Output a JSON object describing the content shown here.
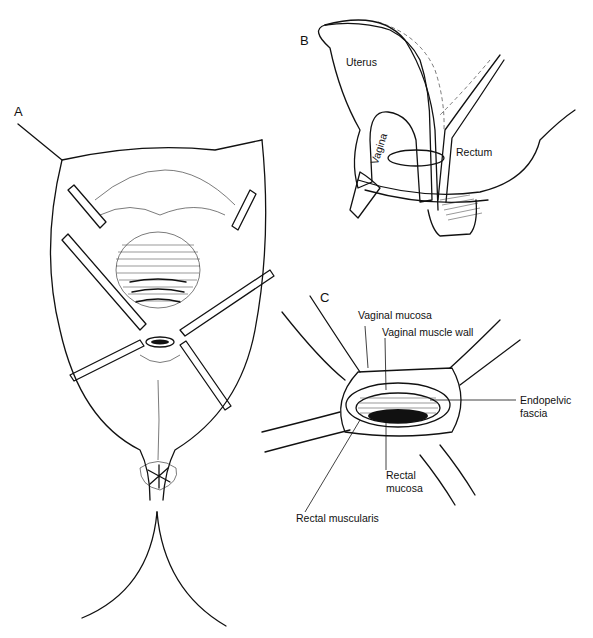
{
  "figure": {
    "panels": [
      {
        "id": "A",
        "label": "A",
        "description": "Perineal view with four retractors exposing rectovaginal region"
      },
      {
        "id": "B",
        "label": "B",
        "description": "Sagittal section of pelvis",
        "labels": {
          "uterus": "Uterus",
          "vagina": "Vagina",
          "rectum": "Rectum"
        }
      },
      {
        "id": "C",
        "label": "C",
        "description": "Close-up of rectovaginal opening with retractors",
        "labels": {
          "vaginal_mucosa": "Vaginal mucosa",
          "vaginal_muscle_wall": "Vaginal muscle wall",
          "endopelvic_fascia_line1": "Endopelvic",
          "endopelvic_fascia_line2": "fascia",
          "rectal_mucosa_line1": "Rectal",
          "rectal_mucosa_line2": "mucosa",
          "rectal_muscularis": "Rectal muscularis"
        }
      }
    ]
  }
}
